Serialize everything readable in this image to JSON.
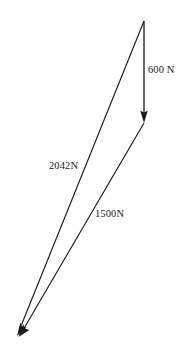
{
  "figure": {
    "type": "force-vector-triangle",
    "background_color": "#ffffff",
    "stroke_color": "#1a1a1a",
    "text_color": "#1a1a1a",
    "canvas": {
      "width": 190,
      "height": 357
    },
    "vectors": [
      {
        "id": "600n",
        "label": "600 N",
        "magnitude": 600,
        "unit": "N",
        "start": {
          "x": 144,
          "y": 21
        },
        "end": {
          "x": 144,
          "y": 123
        },
        "arrowhead": "end",
        "orientation": "vertical-down",
        "label_position": {
          "x": 148,
          "y": 65
        }
      },
      {
        "id": "2042n",
        "label": "2042N",
        "magnitude": 2042,
        "unit": "N",
        "start": {
          "x": 144,
          "y": 21
        },
        "end": {
          "x": 17,
          "y": 336
        },
        "arrowhead": "end",
        "orientation": "down-left",
        "label_position": {
          "x": 49,
          "y": 161
        }
      },
      {
        "id": "1500n",
        "label": "1500N",
        "magnitude": 1500,
        "unit": "N",
        "start": {
          "x": 144,
          "y": 123
        },
        "end": {
          "x": 19,
          "y": 337
        },
        "arrowhead": "end",
        "orientation": "down-left",
        "label_position": {
          "x": 95,
          "y": 209
        }
      }
    ]
  }
}
